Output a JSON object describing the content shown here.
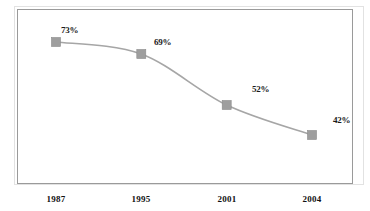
{
  "figure": {
    "top_clipped_text": "",
    "background_color": "#ffffff",
    "outer_border_color": "#e2e2e2",
    "plot_border_color": "#9a9a9a"
  },
  "chart_data": {
    "type": "line",
    "title": "",
    "subtitle": "",
    "xlabel": "",
    "ylabel": "",
    "grid": false,
    "legend": false,
    "legend_position": "none",
    "marker": "square",
    "marker_color": "#9e9e9e",
    "line_color": "#a6a6a6",
    "line_width": 1.6,
    "categories": [
      "1987",
      "1995",
      "2001",
      "2004"
    ],
    "values": [
      73,
      69,
      52,
      42
    ],
    "value_labels": [
      "73%",
      "69%",
      "52%",
      "42%"
    ],
    "ylim": [
      0,
      100
    ],
    "series": [
      {
        "name": "",
        "values": [
          73,
          69,
          52,
          42
        ]
      }
    ]
  },
  "axis": {
    "x_tick_labels": [
      "1987",
      "1995",
      "2001",
      "2004"
    ]
  }
}
